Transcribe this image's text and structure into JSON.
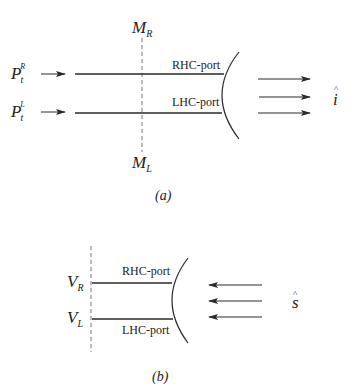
{
  "diagram_a": {
    "caption": "(a)",
    "top_marker": {
      "base": "M",
      "sub": "R"
    },
    "bottom_marker": {
      "base": "M",
      "sub": "L"
    },
    "inputs": [
      {
        "base": "P",
        "sub": "t",
        "sup": "R"
      },
      {
        "base": "P",
        "sub": "t",
        "sup": "L"
      }
    ],
    "ports": [
      "RHC-port",
      "LHC-port"
    ],
    "direction_symbol": {
      "base": "i",
      "hat": "^"
    },
    "arrow_direction": "outgoing",
    "arrow_count": 3
  },
  "diagram_b": {
    "caption": "(b)",
    "voltages": [
      {
        "base": "V",
        "sub": "R"
      },
      {
        "base": "V",
        "sub": "L"
      }
    ],
    "ports": [
      "RHC-port",
      "LHC-port"
    ],
    "direction_symbol": {
      "base": "s",
      "hat": "^"
    },
    "arrow_direction": "incoming",
    "arrow_count": 3
  },
  "colors": {
    "stroke": "#2a2a2a",
    "dashed": "#777777",
    "background": "#ffffff"
  }
}
